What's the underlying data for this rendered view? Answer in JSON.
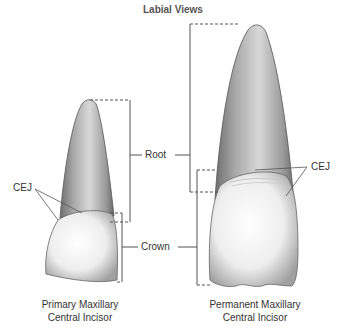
{
  "title": "Labial Views",
  "labels": {
    "root": "Root",
    "crown": "Crown",
    "cej_left": "CEJ",
    "cej_right": "CEJ"
  },
  "teeth": [
    {
      "name": "primary",
      "caption_line1": "Primary Maxillary",
      "caption_line2": "Central Incisor"
    },
    {
      "name": "permanent",
      "caption_line1": "Permanent Maxillary",
      "caption_line2": "Central Incisor"
    }
  ],
  "colors": {
    "line": "#555555",
    "root_shade": "#8a8a8a",
    "crown_fill": "#f4f4f4"
  }
}
